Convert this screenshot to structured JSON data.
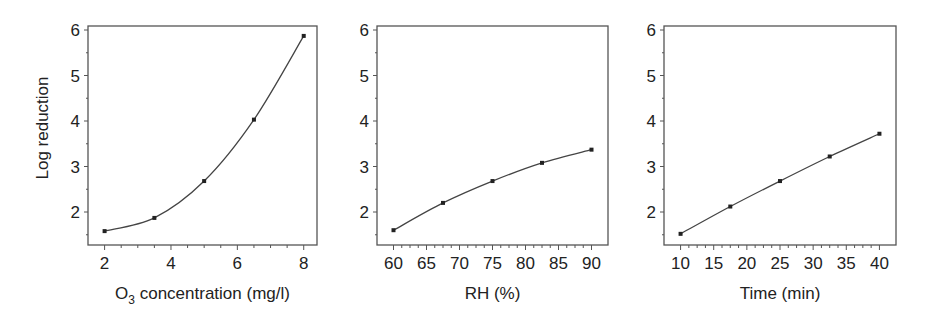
{
  "figure": {
    "ylabel": "Log reduction"
  },
  "chart_data": [
    {
      "type": "line",
      "title": "",
      "xlabel": "O3 concentration (mg/l)",
      "xlabel_main": "O",
      "xlabel_sub": "3",
      "xlabel_rest": " concentration (mg/l)",
      "ylabel": "Log reduction",
      "x": [
        2,
        3.5,
        5,
        6.5,
        8
      ],
      "values": [
        1.58,
        1.87,
        2.68,
        4.03,
        5.87
      ],
      "xticks": [
        2,
        4,
        6,
        8
      ],
      "yticks": [
        2,
        3,
        4,
        5,
        6
      ],
      "xlim": [
        1.5,
        8.4
      ],
      "ylim": [
        1.3,
        6.1
      ],
      "grid": false
    },
    {
      "type": "line",
      "title": "",
      "xlabel": "RH (%)",
      "ylabel": "Log reduction",
      "x": [
        60,
        67.5,
        75,
        82.5,
        90
      ],
      "values": [
        1.6,
        2.2,
        2.68,
        3.08,
        3.37
      ],
      "xticks": [
        60,
        65,
        70,
        75,
        80,
        85,
        90
      ],
      "yticks": [
        2,
        3,
        4,
        5,
        6
      ],
      "xlim": [
        57.5,
        92.5
      ],
      "ylim": [
        1.3,
        6.1
      ],
      "grid": false
    },
    {
      "type": "line",
      "title": "",
      "xlabel": "Time (min)",
      "ylabel": "Log reduction",
      "x": [
        10,
        17.5,
        25,
        32.5,
        40
      ],
      "values": [
        1.52,
        2.12,
        2.68,
        3.22,
        3.72
      ],
      "xticks": [
        10,
        15,
        20,
        25,
        30,
        35,
        40
      ],
      "yticks": [
        2,
        3,
        4,
        5,
        6
      ],
      "xlim": [
        7.5,
        42.5
      ],
      "ylim": [
        1.3,
        6.1
      ],
      "grid": false
    }
  ]
}
